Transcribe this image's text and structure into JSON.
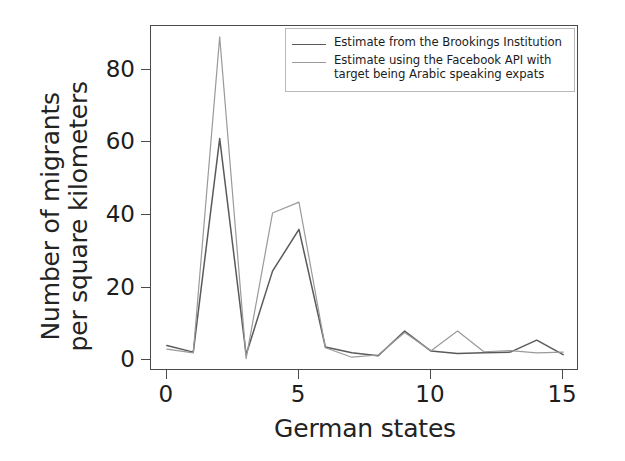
{
  "chart_data": {
    "type": "line",
    "title": "",
    "xlabel": "German states",
    "ylabel": "Number of migrants\nper square kilometers",
    "ylabel_line1": "Number of migrants",
    "ylabel_line2": "per square kilometers",
    "x": [
      0,
      1,
      2,
      3,
      4,
      5,
      6,
      7,
      8,
      9,
      10,
      11,
      12,
      13,
      14,
      15
    ],
    "xlim": [
      -0.6,
      15.6
    ],
    "ylim": [
      -3,
      92
    ],
    "xticks": [
      0,
      5,
      10,
      15
    ],
    "xticklabels": [
      "0",
      "5",
      "10",
      "15"
    ],
    "yticks": [
      0,
      20,
      40,
      60,
      80
    ],
    "yticklabels": [
      "0",
      "20",
      "40",
      "60",
      "80"
    ],
    "grid": false,
    "legend_position": "upper right",
    "series": [
      {
        "name": "Estimate from the Brookings Institution",
        "color": "#5a5a5a",
        "values": [
          4.0,
          2.2,
          61.0,
          1.5,
          24.5,
          36.0,
          3.6,
          2.0,
          1.2,
          8.0,
          2.5,
          1.8,
          2.0,
          2.2,
          5.5,
          1.5
        ]
      },
      {
        "name": "Estimate using the Facebook API with\ntarget being Arabic speaking expats",
        "color": "#9a9a9a",
        "values": [
          3.0,
          2.0,
          89.0,
          0.4,
          40.5,
          43.5,
          3.4,
          0.8,
          1.4,
          7.6,
          2.6,
          8.0,
          2.3,
          2.6,
          2.0,
          2.2
        ]
      }
    ]
  },
  "legend": {
    "entries": [
      {
        "label": "Estimate from the Brookings Institution",
        "color": "#5a5a5a",
        "swatch_name": "legend-swatch-brookings"
      },
      {
        "label": "Estimate using the Facebook API with\ntarget being Arabic speaking expats",
        "color": "#9a9a9a",
        "swatch_name": "legend-swatch-facebook"
      }
    ]
  },
  "axes": {
    "frame_color": "#4a4a4a",
    "tick_color": "#4a4a4a",
    "text_color": "#1d1d1d"
  }
}
